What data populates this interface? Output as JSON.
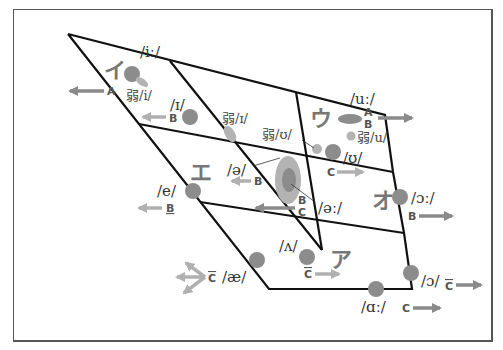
{
  "diagram": {
    "colors": {
      "line": "#111111",
      "dot": "#8c8c8c",
      "dot_light": "#b3b3b3",
      "arrow_dark": "#8a8a8a",
      "arrow_light": "#b0b0b0",
      "kana": "#7a7a7a",
      "frame": "#555555"
    },
    "kana": [
      {
        "label": "イ",
        "x": 104,
        "y": 78
      },
      {
        "label": "ウ",
        "x": 310,
        "y": 126
      },
      {
        "label": "エ",
        "x": 190,
        "y": 180
      },
      {
        "label": "オ",
        "x": 372,
        "y": 208
      },
      {
        "label": "ア",
        "x": 330,
        "y": 267
      }
    ],
    "vowels": [
      {
        "ipa": "/iː/",
        "lx": 140,
        "ly": 52
      },
      {
        "ipa": "弱/i/",
        "lx": 127,
        "ly": 74
      },
      {
        "ipa": "/ɪ/",
        "lx": 170,
        "ly": 108
      },
      {
        "ipa": "弱/ɪ/",
        "lx": 222,
        "ly": 122
      },
      {
        "ipa": "弱/ʊ/",
        "lx": 264,
        "ly": 138
      },
      {
        "ipa": "/uː/",
        "lx": 350,
        "ly": 104
      },
      {
        "ipa": "弱/u/",
        "lx": 357,
        "ly": 141
      },
      {
        "ipa": "/ʊ/",
        "lx": 343,
        "ly": 162
      },
      {
        "ipa": "/ə/",
        "lx": 228,
        "ly": 173
      },
      {
        "ipa": "/əː/",
        "lx": 318,
        "ly": 212
      },
      {
        "ipa": "/e/",
        "lx": 158,
        "ly": 194
      },
      {
        "ipa": "/ɔː/",
        "lx": 411,
        "ly": 203
      },
      {
        "ipa": "/ʌ/",
        "lx": 280,
        "ly": 250
      },
      {
        "ipa": "/æ/",
        "lx": 222,
        "ly": 281
      },
      {
        "ipa": "/ɔ/",
        "lx": 421,
        "ly": 285
      },
      {
        "ipa": "/ɑː/",
        "lx": 362,
        "ly": 311
      }
    ],
    "markers": [
      {
        "text": "A",
        "x": 107,
        "y": 92
      },
      {
        "text": "B",
        "x": 169,
        "y": 122
      },
      {
        "text": "A",
        "x": 364,
        "y": 115
      },
      {
        "text": "B",
        "x": 364,
        "y": 127
      },
      {
        "text": "C",
        "x": 327,
        "y": 176
      },
      {
        "text": "B",
        "x": 254,
        "y": 185
      },
      {
        "text": "B",
        "x": 298,
        "y": 204
      },
      {
        "text": "C",
        "x": 298,
        "y": 216
      },
      {
        "text": "B",
        "x": 166,
        "y": 212
      },
      {
        "text": "B",
        "x": 409,
        "y": 220
      },
      {
        "text": "C",
        "x": 305,
        "y": 276
      },
      {
        "text": "C",
        "x": 209,
        "y": 281
      },
      {
        "text": "C",
        "x": 445,
        "y": 287
      },
      {
        "text": "C",
        "x": 402,
        "y": 311
      }
    ]
  }
}
